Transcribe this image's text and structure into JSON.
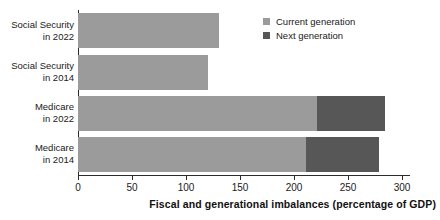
{
  "chart_data": {
    "type": "bar",
    "orientation": "horizontal",
    "stacked": true,
    "title": "",
    "xlabel": "Fiscal and generational imbalances (percentage of GDP)",
    "ylabel": "",
    "xlim": [
      0,
      300
    ],
    "xticks": [
      0,
      50,
      100,
      150,
      200,
      250,
      300
    ],
    "xtick_labels": [
      "0",
      "50",
      "100",
      "150",
      "200",
      "250",
      "300"
    ],
    "grid": false,
    "legend_position": "top-right",
    "categories": [
      "Social Security in 2022",
      "Social Security in 2014",
      "Medicare in 2022",
      "Medicare in 2014"
    ],
    "category_lines": [
      [
        "Social Security",
        "in 2022"
      ],
      [
        "Social Security",
        "in 2014"
      ],
      [
        "Medicare",
        "in 2022"
      ],
      [
        "Medicare",
        "in 2014"
      ]
    ],
    "series": [
      {
        "name": "Current generation",
        "color": "#9b9b9b",
        "values": [
          131,
          120,
          221,
          211
        ]
      },
      {
        "name": "Next generation",
        "color": "#575757",
        "values": [
          0,
          0,
          63,
          68
        ]
      }
    ],
    "totals": [
      131,
      120,
      284,
      279
    ]
  },
  "legend": {
    "items": [
      {
        "label": "Current generation",
        "color": "#9b9b9b"
      },
      {
        "label": "Next generation",
        "color": "#575757"
      }
    ]
  },
  "axis": {
    "x_title": "Fiscal and generational imbalances (percentage of GDP)",
    "tick_labels": [
      "0",
      "50",
      "100",
      "150",
      "200",
      "250",
      "300"
    ]
  }
}
